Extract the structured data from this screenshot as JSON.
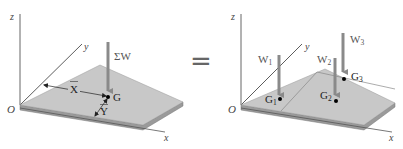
{
  "left_figure": {
    "axes": {
      "z": "z",
      "y": "y",
      "x": "x",
      "origin": "O"
    },
    "force_label": "ΣW",
    "centroid_label": "G",
    "x_bar_label": "X",
    "y_bar_label": "Y"
  },
  "equals_sign": "=",
  "right_figure": {
    "axes": {
      "z": "z",
      "y": "y",
      "x": "x",
      "origin": "O"
    },
    "forces": [
      {
        "label": "W",
        "sub": "1"
      },
      {
        "label": "W",
        "sub": "2"
      },
      {
        "label": "W",
        "sub": "3"
      }
    ],
    "points": [
      {
        "label": "G",
        "sub": "1"
      },
      {
        "label": "G",
        "sub": "2"
      },
      {
        "label": "G",
        "sub": "3"
      }
    ]
  },
  "colors": {
    "plate_top": "#c8c8c8",
    "plate_edge": "#9a9a9a",
    "arrow": "#8a8a8a",
    "axis": "#555555"
  }
}
